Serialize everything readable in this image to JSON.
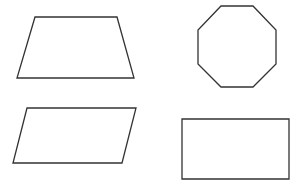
{
  "canvas": {
    "width": 301,
    "height": 184,
    "background": "#ffffff"
  },
  "style": {
    "stroke": "#333333",
    "stroke_width": 1.3
  },
  "shapes": [
    {
      "id": "trapezoid",
      "type": "trapezoid",
      "points": "35,17 117,17 134,78 17,78"
    },
    {
      "id": "octagon",
      "type": "octagon",
      "points": "221,6 253,6 276,30 276,64 253,87 221,87 198,64 198,30"
    },
    {
      "id": "parallelogram",
      "type": "parallelogram",
      "points": "27,108 136,108 122,163 13,163"
    },
    {
      "id": "rectangle",
      "type": "rectangle",
      "points": "182,119 289,119 289,179 182,179"
    }
  ]
}
